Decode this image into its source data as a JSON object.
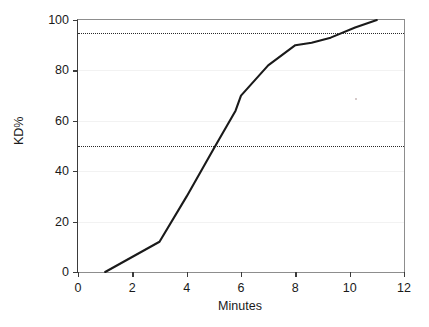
{
  "chart_data": {
    "type": "line",
    "title": "",
    "xlabel": "Minutes",
    "ylabel": "KD%",
    "xlim": [
      0,
      12
    ],
    "ylim": [
      0,
      100
    ],
    "xticks": [
      0,
      2,
      4,
      6,
      8,
      10,
      12
    ],
    "yticks": [
      0,
      20,
      40,
      60,
      80,
      100
    ],
    "xtick_labels": [
      "0",
      "2",
      "4",
      "6",
      "8",
      "10",
      "12"
    ],
    "ytick_labels": [
      "0",
      "20",
      "40",
      "60",
      "80",
      "100"
    ],
    "grid": "horizontal-faint",
    "legend": "none",
    "series": [
      {
        "name": "KD%",
        "color": "#1a1a1a",
        "x": [
          1.0,
          3.0,
          4.0,
          5.0,
          5.8,
          6.0,
          7.0,
          8.0,
          8.6,
          9.3,
          10.2,
          11.0
        ],
        "values": [
          0,
          12,
          30,
          49,
          64,
          70,
          82,
          90,
          91,
          93,
          97,
          100
        ]
      }
    ],
    "annotations": [
      {
        "name": "kd95-threshold",
        "type": "hline",
        "y": 95,
        "style": "dotted",
        "color": "#2a2a2a",
        "label": ""
      },
      {
        "name": "kd50-threshold",
        "type": "hline",
        "y": 50,
        "style": "dotted",
        "color": "#2a2a2a",
        "label": ""
      }
    ]
  }
}
